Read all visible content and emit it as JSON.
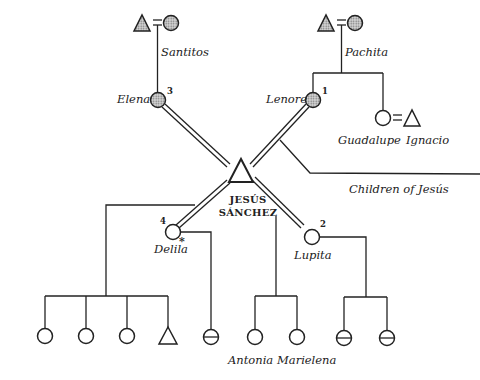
{
  "diagram": {
    "type": "kinship-chart",
    "title": "Children of Jesús",
    "ego": {
      "first": "Jesús",
      "last": "Sánchez",
      "first_display": "JESÚS",
      "last_display": "SÁNCHEZ",
      "symbol": "triangle"
    },
    "grandparents": [
      {
        "label": "Santitos",
        "couple": [
          "triangle-shaded",
          "circle-shaded"
        ]
      },
      {
        "label": "Pachita",
        "couple": [
          "triangle-shaded",
          "circle-shaded"
        ]
      }
    ],
    "wives": [
      {
        "name": "Lenore",
        "order": "1",
        "shaded": true
      },
      {
        "name": "Lupita",
        "order": "2",
        "shaded": false
      },
      {
        "name": "Elena",
        "order": "3",
        "shaded": true
      },
      {
        "name": "Delila",
        "order": "4",
        "shaded": false,
        "mark": "*"
      }
    ],
    "others": [
      {
        "name": "Guadalupe",
        "symbol": "circle"
      },
      {
        "name": "Ignacio",
        "symbol": "triangle"
      }
    ],
    "children_labels": [
      "Antonia",
      "Marielena"
    ],
    "annotation": "Children of Jesús",
    "colors": {
      "line": "#222222",
      "background": "#ffffff",
      "shade": "#9a9a9a"
    }
  }
}
